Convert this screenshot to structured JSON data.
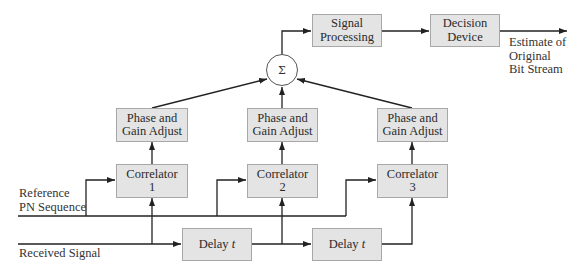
{
  "diagram": {
    "type": "block-diagram",
    "summer": {
      "symbol": "Σ"
    },
    "blocks": {
      "signal_processing": {
        "line1": "Signal",
        "line2": "Processing"
      },
      "decision_device": {
        "line1": "Decision",
        "line2": "Device"
      },
      "phase_gain": [
        {
          "line1": "Phase and",
          "line2": "Gain Adjust"
        },
        {
          "line1": "Phase and",
          "line2": "Gain Adjust"
        },
        {
          "line1": "Phase and",
          "line2": "Gain Adjust"
        }
      ],
      "correlators": [
        {
          "line1": "Correlator",
          "line2": "1"
        },
        {
          "line1": "Correlator",
          "line2": "2"
        },
        {
          "line1": "Correlator",
          "line2": "3"
        }
      ],
      "delays": [
        {
          "text": "Delay ",
          "var": "t"
        },
        {
          "text": "Delay ",
          "var": "t"
        }
      ]
    },
    "labels": {
      "output": [
        "Estimate of",
        "Original",
        "Bit Stream"
      ],
      "reference": [
        "Reference",
        "PN Sequence"
      ],
      "received": "Received Signal"
    },
    "colors": {
      "box_fill": "#e4e4e4",
      "box_border": "#a8a8a8",
      "line": "#222222"
    }
  }
}
